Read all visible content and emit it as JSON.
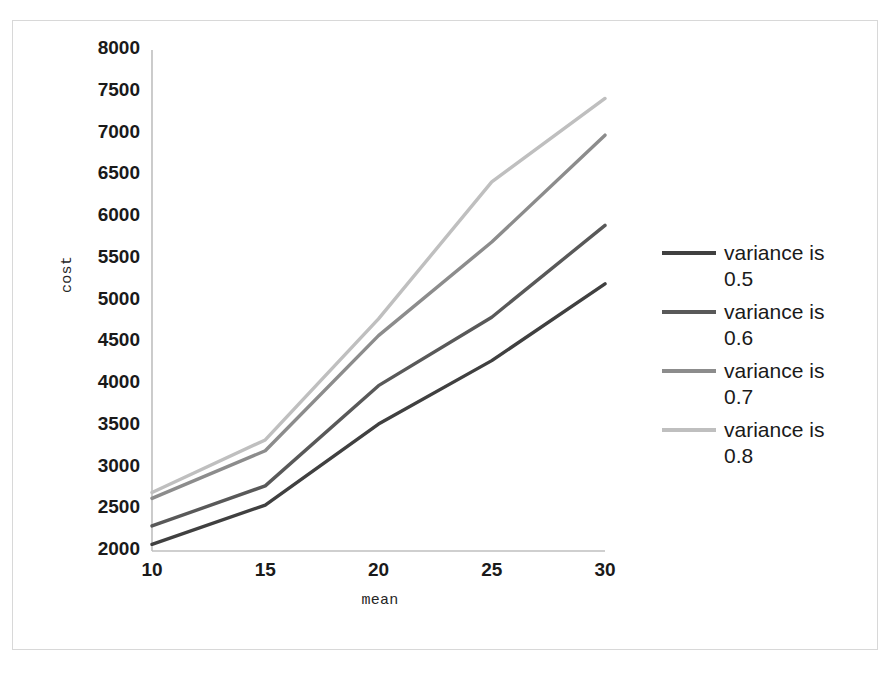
{
  "chart_data": {
    "type": "line",
    "title": "",
    "xlabel": "mean",
    "ylabel": "cost",
    "x": [
      10,
      15,
      20,
      25,
      30
    ],
    "xtick_labels": [
      "10",
      "15",
      "20",
      "25",
      "30"
    ],
    "ytick_labels": [
      "2000",
      "2500",
      "3000",
      "3500",
      "4000",
      "4500",
      "5000",
      "5500",
      "6000",
      "6500",
      "7000",
      "7500",
      "8000"
    ],
    "ylim": [
      2000,
      8000
    ],
    "xlim": [
      10,
      30
    ],
    "ytick_step": 500,
    "grid": false,
    "legend_position": "right",
    "series": [
      {
        "name": "variance is 0.5",
        "color": "#404040",
        "values": [
          2080,
          2550,
          3520,
          4280,
          5200
        ]
      },
      {
        "name": "variance is 0.6",
        "color": "#595959",
        "values": [
          2300,
          2780,
          3980,
          4800,
          5900
        ]
      },
      {
        "name": "variance is 0.7",
        "color": "#8c8c8c",
        "values": [
          2630,
          3200,
          4580,
          5700,
          6980
        ]
      },
      {
        "name": "variance is 0.8",
        "color": "#bfbfbf",
        "values": [
          2700,
          3330,
          4780,
          6420,
          7420
        ]
      }
    ]
  },
  "legend": {
    "items": [
      {
        "label": "variance is 0.5",
        "color": "#404040"
      },
      {
        "label": "variance is 0.6",
        "color": "#595959"
      },
      {
        "label": "variance is 0.7",
        "color": "#8c8c8c"
      },
      {
        "label": "variance is 0.8",
        "color": "#bfbfbf"
      }
    ]
  },
  "axes": {
    "x_title": "mean",
    "y_title": "cost",
    "axis_color": "#bfbfbf"
  }
}
